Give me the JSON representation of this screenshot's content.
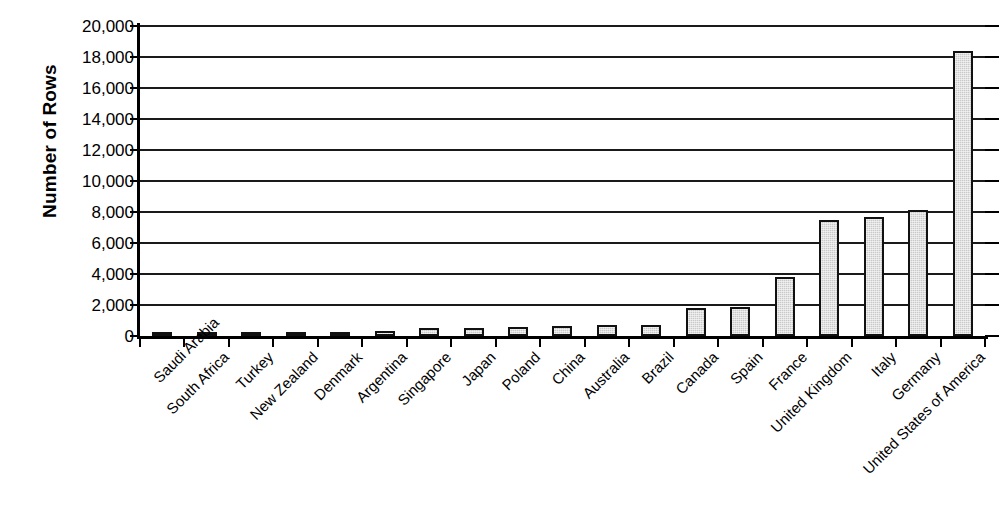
{
  "chart_data": {
    "type": "bar",
    "title": "",
    "subtitle": "",
    "xlabel": "",
    "ylabel": "Number of Rows",
    "ylim": [
      0,
      20000
    ],
    "ytick_labels": [
      "0",
      "2,000",
      "4,000",
      "6,000",
      "8,000",
      "10,000",
      "12,000",
      "14,000",
      "16,000",
      "18,000",
      "20,000"
    ],
    "ytick_values": [
      0,
      2000,
      4000,
      6000,
      8000,
      10000,
      12000,
      14000,
      16000,
      18000,
      20000
    ],
    "grid": "horizontal",
    "legend": "none",
    "bar_color": "#c9c9c9",
    "bar_border_color": "#111111",
    "axis_color": "#000000",
    "background_color": "#ffffff",
    "categories": [
      "Saudi Arabia",
      "South Africa",
      "Turkey",
      "New Zealand",
      "Denmark",
      "Argentina",
      "Singapore",
      "Japan",
      "Poland",
      "China",
      "Australia",
      "Brazil",
      "Canada",
      "Spain",
      "France",
      "United Kingdom",
      "Italy",
      "Germany",
      "United States of America"
    ],
    "values": [
      50,
      80,
      90,
      230,
      270,
      330,
      530,
      530,
      600,
      620,
      700,
      730,
      1800,
      1880,
      3800,
      7500,
      7700,
      8100,
      18400
    ],
    "series": [
      {
        "name": "Number of Rows",
        "values": [
          50,
          80,
          90,
          230,
          270,
          330,
          530,
          530,
          600,
          620,
          700,
          730,
          1800,
          1880,
          3800,
          7500,
          7700,
          8100,
          18400
        ]
      }
    ],
    "annotations": []
  }
}
